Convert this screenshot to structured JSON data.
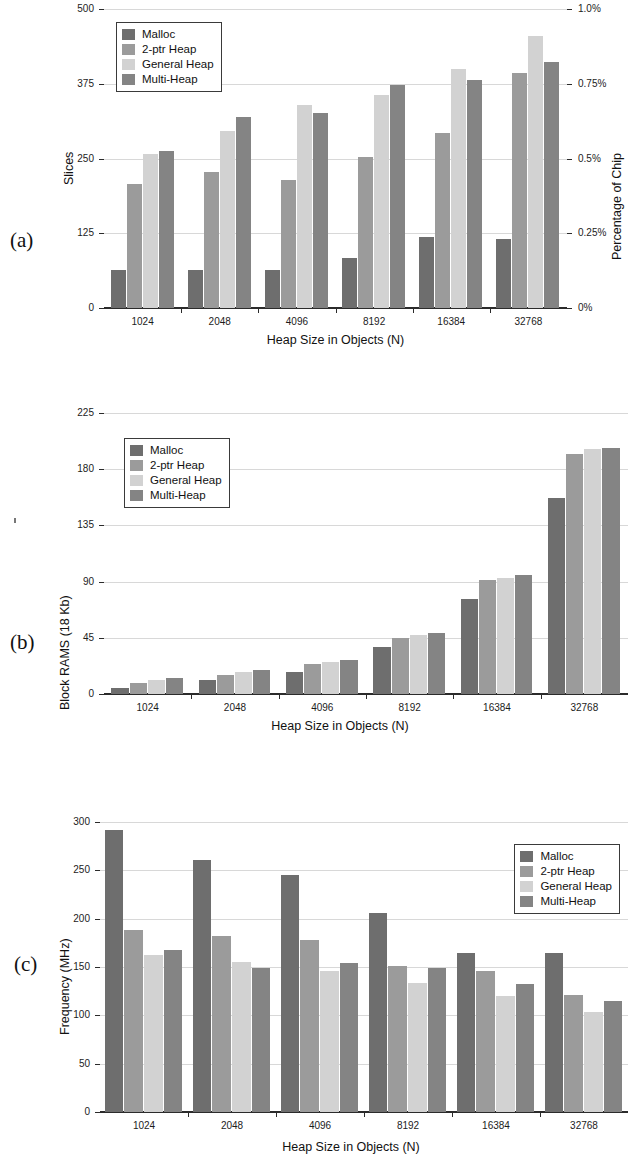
{
  "series_names": [
    "Malloc",
    "2-ptr Heap",
    "General Heap",
    "Multi-Heap"
  ],
  "series_colors": [
    "#6e6e6e",
    "#9b9b9b",
    "#d2d2d2",
    "#848484"
  ],
  "categories": [
    "1024",
    "2048",
    "4096",
    "8192",
    "16384",
    "32768"
  ],
  "xlabel": "Heap Size in Objects (N)",
  "panels": {
    "a": {
      "tag": "(a)",
      "ylabel": "Slices",
      "ylabel_right": "Percentage of Chip",
      "yticks": [
        "0",
        "125",
        "250",
        "375",
        "500"
      ],
      "yticks_right": [
        "0%",
        "0.25%",
        "0.5%",
        "0.75%",
        "1.0%"
      ]
    },
    "b": {
      "tag": "(b)",
      "ylabel": "Block RAMS (18 Kb)",
      "yticks": [
        "0",
        "45",
        "90",
        "135",
        "180",
        "225"
      ]
    },
    "c": {
      "tag": "(c)",
      "ylabel": "Frequency (MHz)",
      "yticks": [
        "0",
        "50",
        "100",
        "150",
        "200",
        "250",
        "300"
      ]
    }
  },
  "chart_data": [
    {
      "type": "bar",
      "panel": "a",
      "title": "",
      "xlabel": "Heap Size in Objects (N)",
      "ylabel": "Slices",
      "ylabel_secondary": "Percentage of Chip",
      "categories": [
        "1024",
        "2048",
        "4096",
        "8192",
        "16384",
        "32768"
      ],
      "ylim": [
        0,
        500
      ],
      "yticks": [
        0,
        125,
        250,
        375,
        500
      ],
      "ylim_secondary": [
        0,
        1.0
      ],
      "yticks_secondary": [
        0,
        0.25,
        0.5,
        0.75,
        1.0
      ],
      "grid": true,
      "legend_position": "top-left",
      "series": [
        {
          "name": "Malloc",
          "values": [
            63,
            63,
            63,
            84,
            118,
            116
          ]
        },
        {
          "name": "2-ptr Heap",
          "values": [
            207,
            228,
            214,
            252,
            292,
            393
          ]
        },
        {
          "name": "General Heap",
          "values": [
            257,
            296,
            339,
            356,
            400,
            455
          ]
        },
        {
          "name": "Multi-Heap",
          "values": [
            263,
            319,
            326,
            373,
            381,
            412
          ]
        }
      ]
    },
    {
      "type": "bar",
      "panel": "b",
      "title": "",
      "xlabel": "Heap Size in Objects (N)",
      "ylabel": "Block RAMS (18 Kb)",
      "categories": [
        "1024",
        "2048",
        "4096",
        "8192",
        "16384",
        "32768"
      ],
      "ylim": [
        0,
        225
      ],
      "yticks": [
        0,
        45,
        90,
        135,
        180,
        225
      ],
      "grid": true,
      "legend_position": "top-left",
      "series": [
        {
          "name": "Malloc",
          "values": [
            5,
            11,
            18,
            38,
            76,
            157
          ]
        },
        {
          "name": "2-ptr Heap",
          "values": [
            9,
            15,
            24,
            45,
            91,
            192
          ]
        },
        {
          "name": "General Heap",
          "values": [
            11,
            18,
            26,
            47,
            93,
            196
          ]
        },
        {
          "name": "Multi-Heap",
          "values": [
            13,
            19,
            27,
            49,
            95,
            197
          ]
        }
      ]
    },
    {
      "type": "bar",
      "panel": "c",
      "title": "",
      "xlabel": "Heap Size in Objects (N)",
      "ylabel": "Frequency (MHz)",
      "categories": [
        "1024",
        "2048",
        "4096",
        "8192",
        "16384",
        "32768"
      ],
      "ylim": [
        0,
        300
      ],
      "yticks": [
        0,
        50,
        100,
        150,
        200,
        250,
        300
      ],
      "grid": true,
      "legend_position": "top-right",
      "series": [
        {
          "name": "Malloc",
          "values": [
            292,
            261,
            245,
            206,
            165,
            164
          ]
        },
        {
          "name": "2-ptr Heap",
          "values": [
            188,
            182,
            178,
            151,
            146,
            121
          ]
        },
        {
          "name": "General Heap",
          "values": [
            162,
            155,
            146,
            133,
            120,
            103
          ]
        },
        {
          "name": "Multi-Heap",
          "values": [
            168,
            149,
            154,
            149,
            132,
            115
          ]
        }
      ]
    }
  ]
}
